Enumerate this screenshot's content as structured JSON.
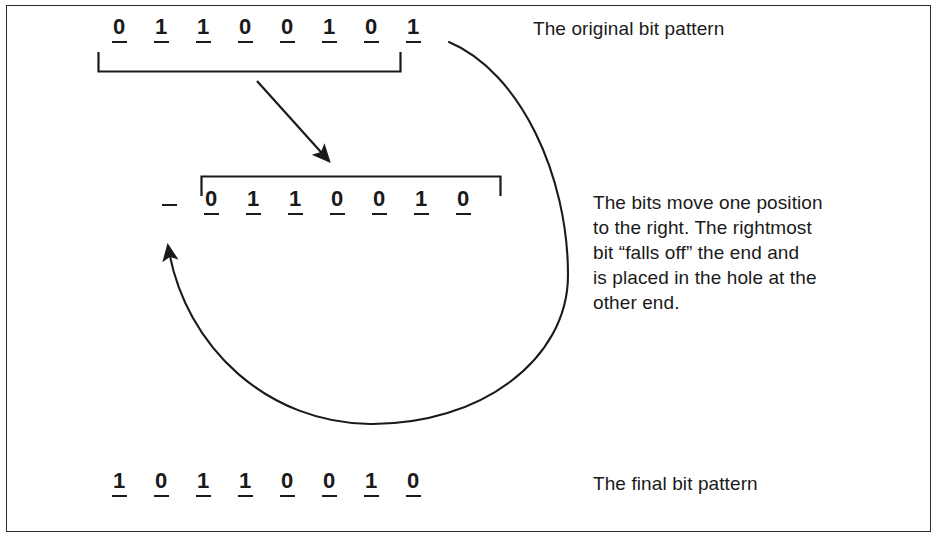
{
  "figure": {
    "background_color": "#ffffff",
    "frame_color": "#2b2b2b",
    "ink_color": "#1a1a1a",
    "highlight_color": "#d6d6d6"
  },
  "rows": {
    "original": {
      "name": "original-bit-pattern",
      "bits": [
        {
          "value": "0",
          "style": "plain"
        },
        {
          "value": "1",
          "style": "plain"
        },
        {
          "value": "1",
          "style": "plain"
        },
        {
          "value": "0",
          "style": "plain"
        },
        {
          "value": "0",
          "style": "plain"
        },
        {
          "value": "1",
          "style": "plain"
        },
        {
          "value": "0",
          "style": "plain"
        },
        {
          "value": "1",
          "style": "circled"
        }
      ]
    },
    "shifted": {
      "name": "shifted-bit-pattern",
      "bits": [
        {
          "value": "",
          "style": "hole"
        },
        {
          "value": "0",
          "style": "plain"
        },
        {
          "value": "1",
          "style": "plain"
        },
        {
          "value": "1",
          "style": "plain"
        },
        {
          "value": "0",
          "style": "plain"
        },
        {
          "value": "0",
          "style": "plain"
        },
        {
          "value": "1",
          "style": "plain"
        },
        {
          "value": "0",
          "style": "plain"
        }
      ]
    },
    "final": {
      "name": "final-bit-pattern",
      "bits": [
        {
          "value": "1",
          "style": "plain"
        },
        {
          "value": "0",
          "style": "plain"
        },
        {
          "value": "1",
          "style": "plain"
        },
        {
          "value": "1",
          "style": "plain"
        },
        {
          "value": "0",
          "style": "plain"
        },
        {
          "value": "0",
          "style": "plain"
        },
        {
          "value": "1",
          "style": "plain"
        },
        {
          "value": "0",
          "style": "plain"
        }
      ]
    }
  },
  "captions": {
    "original": "The original bit pattern",
    "middle": "The bits move one position\nto the right. The rightmost\nbit “falls off” the end and\nis placed in the hole at the\nother end.",
    "final": "The final bit pattern"
  },
  "annotations": {
    "shift_arrow": "straight-arrow-down-right",
    "wrap_arrow": "curved-arrow-wrap-around",
    "top_bracket": "group-bracket-original-bits",
    "middle_bracket": "group-bracket-shifted-bits"
  }
}
